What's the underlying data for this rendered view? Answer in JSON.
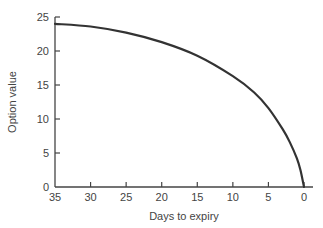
{
  "chart_data": {
    "type": "line",
    "title": "",
    "xlabel": "Days to expiry",
    "ylabel": "Option value",
    "x_reversed": true,
    "xlim": [
      35,
      0
    ],
    "ylim": [
      0,
      25
    ],
    "xticks": [
      35,
      30,
      25,
      20,
      15,
      10,
      5,
      0
    ],
    "yticks": [
      0,
      5,
      10,
      15,
      20,
      25
    ],
    "grid": false,
    "legend": null,
    "series": [
      {
        "name": "Option value",
        "color": "#333333",
        "x": [
          35,
          30,
          25,
          20,
          15,
          10,
          7,
          5,
          3,
          2,
          1,
          0.5,
          0
        ],
        "y": [
          24,
          23.6,
          22.7,
          21.3,
          19.3,
          16.3,
          13.9,
          11.6,
          8.5,
          6.6,
          4.2,
          2.5,
          0
        ]
      }
    ]
  }
}
